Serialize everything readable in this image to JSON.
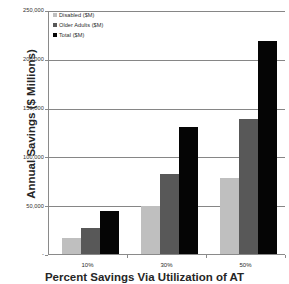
{
  "chart_data": {
    "type": "bar",
    "title": "",
    "subtitle": "",
    "xlabel": "Percent Savings Via Utilization of AT",
    "ylabel": "Annual Savings ($ Millions)",
    "categories": [
      "10%",
      "30%",
      "50%"
    ],
    "series": [
      {
        "name": "Disabled ($M)",
        "color": "#bfbfbf",
        "values": [
          17000,
          50000,
          79000
        ]
      },
      {
        "name": "Older Adults ($M)",
        "color": "#585858",
        "values": [
          28000,
          83000,
          139000
        ]
      },
      {
        "name": "Total ($M)",
        "color": "#050505",
        "values": [
          45000,
          131000,
          219000
        ]
      }
    ],
    "ylim": [
      0,
      250000
    ],
    "ytick_values": [
      0,
      50000,
      100000,
      150000,
      200000,
      250000
    ],
    "ytick_labels": [
      "-",
      "50,000",
      "100,000",
      "150,000",
      "200,000",
      "250,000"
    ],
    "grid": true,
    "legend_position": "top-left",
    "bar_grouping": "grouped"
  },
  "axes": {
    "y_title": "Annual Savings ($ Millions)",
    "x_title": "Percent Savings Via Utilization of AT"
  },
  "legend": {
    "entries": [
      {
        "label": "Disabled ($M)"
      },
      {
        "label": "Older Adults ($M)"
      },
      {
        "label": "Total ($M)"
      }
    ]
  }
}
